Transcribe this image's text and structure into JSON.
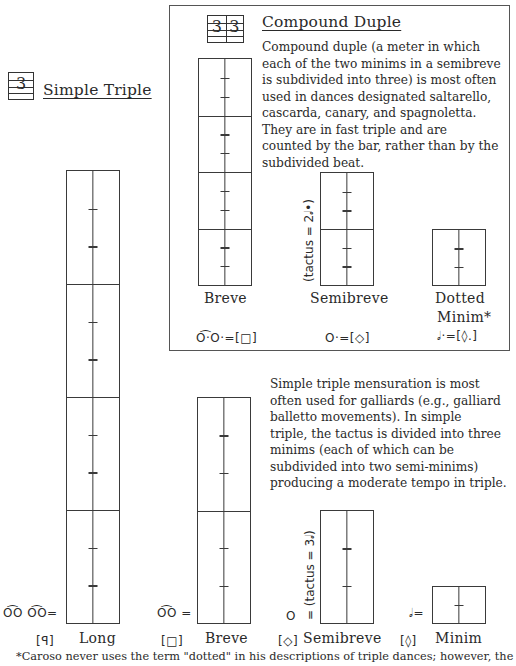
{
  "compound": {
    "signature": [
      "3",
      "3"
    ],
    "title": "Compound Duple",
    "description": [
      "Compound duple (a meter in which",
      "each of the two minims in a semibreve",
      "is subdivided into three) is most often",
      "used in dances designated saltarello,",
      "cascarda, canary, and spagnoletta.",
      "They are in fast triple and are",
      "counted by the bar, rather than by the",
      "subdivided beat."
    ],
    "tactus_label": "(tactus = 2𝅗𝅥•)",
    "notes": [
      {
        "name": "Breve",
        "equation": "O͡·O·=[□]",
        "divisions": 4,
        "ticks_per_division": 2
      },
      {
        "name": "Semibreve",
        "equation": "O·=[◇]",
        "divisions": 2,
        "ticks_per_division": 2
      },
      {
        "name": "Dotted",
        "name2": "Minim*",
        "equation": "𝅗𝅥·=[◊.]",
        "divisions": 1,
        "ticks_per_division": 2
      }
    ]
  },
  "simple": {
    "signature": "3",
    "title": "Simple Triple",
    "description": [
      "Simple triple mensuration is most",
      "often used for galliards (e.g., galliard",
      "balletto movements).  In simple",
      "triple, the tactus is divided into three",
      "minims (each of which can be",
      "subdivided into two semi-minims)",
      "producing  a moderate tempo in triple."
    ],
    "tactus_label": "= (tactus = 3𝅗𝅥)",
    "notes": [
      {
        "name": "Long",
        "bracket": "[ꟼ]",
        "equation": "O͡O O͡O=",
        "divisions": 4,
        "ticks_per_division": 2
      },
      {
        "name": "Breve",
        "bracket": "[□]",
        "equation": "O͡O =",
        "divisions": 2,
        "ticks_per_division": 2
      },
      {
        "name": "Semibreve",
        "bracket": "[◇]",
        "equation": "O",
        "divisions": 1,
        "ticks_per_division": 2
      },
      {
        "name": "Minim",
        "bracket": "[◊]",
        "equation": "𝅗𝅥=",
        "divisions": 1,
        "ticks_per_division": 1
      }
    ]
  },
  "footnote": "*Caroso never uses the term \"dotted\" in his descriptions of  triple dances; however, the"
}
